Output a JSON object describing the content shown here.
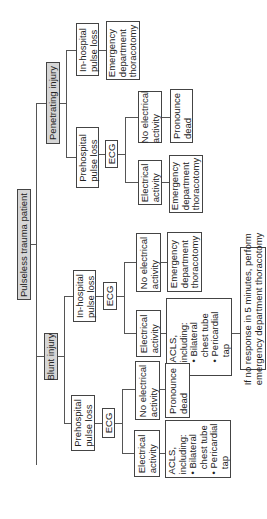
{
  "root": "Pulseless trauma patient",
  "penetrating": {
    "label": "Penetrating injury",
    "in_hospital": "In-hospital\npulse loss",
    "in_hospital_action": "Emergency\ndepartment\nthoracotomy",
    "prehospital": "Prehospital\npulse loss",
    "ecg": "ECG",
    "no_elec": "No electrical\nactivity",
    "no_elec_action": "Pronounce\ndead",
    "elec": "Electrical\nactivity",
    "elec_action": "Emergency\ndepartment\nthoracotomy"
  },
  "blunt": {
    "label": "Blunt injury",
    "in_hospital": "In-hospital\npulse loss",
    "ecg": "ECG",
    "no_elec": "No electrical\nactivity",
    "no_elec_action": "Emergency\ndepartment\nthoracotomy",
    "elec": "Electrical\nactivity",
    "elec_action": "ACLS,\nincluding:\n• Bilateral\n  chest tube\n• Pericardial\n  tap",
    "followup": "If no response in 5 minutes, perform\nemergency department thoracotomy",
    "prehospital": "Prehospital\npulse loss",
    "pre_ecg": "ECG",
    "pre_no_elec": "No electrical\nactivity",
    "pre_no_elec_action": "Pronounce\ndead",
    "pre_elec": "Electrical\nactivity",
    "pre_elec_action": "ACLS,\nincluding:\n• Bilateral\n  chest tube\n• Pericardial\n  tap"
  }
}
